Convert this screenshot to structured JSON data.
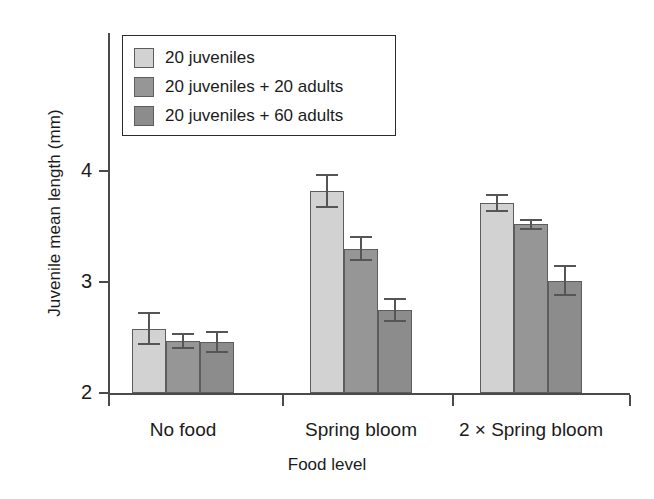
{
  "chart_data": {
    "type": "bar",
    "title": "",
    "xlabel": "Food level",
    "ylabel": "Juvenile mean length (mm)",
    "categories": [
      "No food",
      "Spring bloom",
      "2 × Spring bloom"
    ],
    "ylim": [
      2,
      4.35
    ],
    "yticks": [
      2,
      3,
      4
    ],
    "ytick_labels": [
      "2",
      "3",
      "4"
    ],
    "grid": false,
    "legend_position": "top-left",
    "error_bars": "symmetric",
    "series": [
      {
        "name": "20 juveniles",
        "color": "#d2d2d2",
        "values": [
          2.58,
          3.82,
          3.71
        ],
        "errors": [
          0.15,
          0.15,
          0.08
        ]
      },
      {
        "name": "20 juveniles + 20 adults",
        "color": "#969696",
        "values": [
          2.47,
          3.3,
          3.52
        ],
        "errors": [
          0.07,
          0.11,
          0.05
        ]
      },
      {
        "name": "20 juveniles + 60 adults",
        "color": "#8c8c8c",
        "values": [
          2.46,
          2.75,
          3.01
        ],
        "errors": [
          0.1,
          0.11,
          0.14
        ]
      }
    ]
  },
  "legend": {
    "items": [
      {
        "label": "20 juveniles"
      },
      {
        "label": "20 juveniles + 20 adults"
      },
      {
        "label": "20 juveniles + 60 adults"
      }
    ]
  }
}
